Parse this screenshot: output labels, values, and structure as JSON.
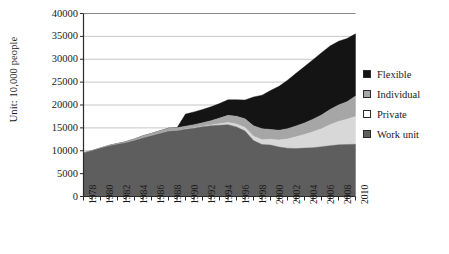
{
  "chart_data": {
    "type": "area",
    "stacked": true,
    "title": "",
    "xlabel": "",
    "ylabel": "Unit: 10,000 people",
    "ylim": [
      0,
      40000
    ],
    "ytick_step": 5000,
    "yticks": [
      0,
      5000,
      10000,
      15000,
      20000,
      25000,
      30000,
      35000,
      40000
    ],
    "grid": true,
    "legend_position": "right",
    "xlim": [
      1978,
      2010
    ],
    "x": [
      1978,
      1979,
      1980,
      1981,
      1982,
      1983,
      1984,
      1985,
      1986,
      1987,
      1988,
      1989,
      1990,
      1991,
      1992,
      1993,
      1994,
      1995,
      1996,
      1997,
      1998,
      1999,
      2000,
      2001,
      2002,
      2003,
      2004,
      2005,
      2006,
      2007,
      2008,
      2009,
      2010
    ],
    "xtick_labels": [
      "1978",
      "1980",
      "1982",
      "1984",
      "1986",
      "1988",
      "1990",
      "1992",
      "1994",
      "1996",
      "1998",
      "2000",
      "2002",
      "2004",
      "2006",
      "2008",
      "2010"
    ],
    "xticks_major": [
      1978,
      1980,
      1982,
      1984,
      1986,
      1988,
      1990,
      1992,
      1994,
      1996,
      1998,
      2000,
      2002,
      2004,
      2006,
      2008,
      2010
    ],
    "series": [
      {
        "name": "Work unit",
        "color": "#5e5e5e",
        "values": [
          9514,
          9999,
          10525,
          11053,
          11428,
          11746,
          12229,
          12808,
          13293,
          13783,
          14267,
          14390,
          14700,
          14942,
          15266,
          15451,
          15576,
          15697,
          15214,
          14316,
          12215,
          11369,
          11259,
          10822,
          10558,
          10492,
          10576,
          10670,
          10869,
          11099,
          11294,
          11360,
          11427
        ],
        "legend_index": 3
      },
      {
        "name": "Private",
        "color": "#d8d8d8",
        "values": [
          0,
          0,
          0,
          0,
          0,
          0,
          0,
          0,
          0,
          0,
          0,
          0,
          57,
          68,
          98,
          186,
          332,
          485,
          620,
          750,
          973,
          1053,
          1268,
          1527,
          1999,
          2545,
          2994,
          3458,
          3954,
          4581,
          5124,
          5544,
          6071
        ],
        "legend_index": 2
      },
      {
        "name": "Individual",
        "color": "#a6a6a6",
        "values": [
          15,
          32,
          81,
          113,
          147,
          231,
          339,
          450,
          483,
          569,
          659,
          648,
          614,
          692,
          740,
          930,
          1225,
          1560,
          1709,
          1919,
          2259,
          2414,
          2136,
          2131,
          2269,
          2377,
          2521,
          2778,
          3012,
          3310,
          3609,
          3827,
          4467
        ],
        "legend_index": 1
      },
      {
        "name": "Flexible",
        "color": "#141414",
        "values": [
          0,
          0,
          0,
          0,
          0,
          0,
          0,
          0,
          0,
          0,
          0,
          0,
          2640,
          2790,
          2920,
          3050,
          3200,
          3400,
          3620,
          4100,
          6300,
          7300,
          8500,
          9600,
          10600,
          11500,
          12300,
          13000,
          13600,
          13900,
          13900,
          13800,
          13600
        ],
        "legend_index": 0
      }
    ]
  },
  "legend": {
    "items": [
      {
        "label": "Flexible",
        "color": "#141414"
      },
      {
        "label": "Individual",
        "color": "#a6a6a6"
      },
      {
        "label": "Private",
        "color": "#fdfdfd"
      },
      {
        "label": "Work unit",
        "color": "#5e5e5e"
      }
    ]
  },
  "axes": {
    "y_title": "Unit: 10,000 people"
  }
}
